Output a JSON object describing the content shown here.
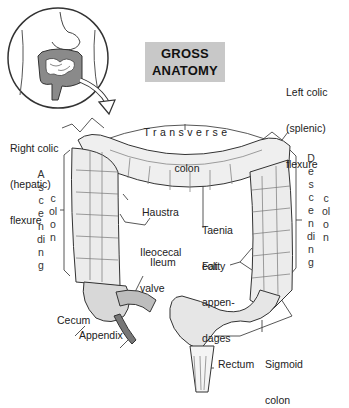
{
  "title": {
    "line1": "GROSS",
    "line2": "ANATOMY"
  },
  "labels": {
    "right_colic": {
      "line1": "Right colic",
      "line2": "(hepatic)",
      "line3": "flexure"
    },
    "transverse": {
      "line1": "Transverse",
      "line2": "colon"
    },
    "left_colic": {
      "line1": "Left colic",
      "line2": "(splenic)",
      "line3": "flexure"
    },
    "ascending": {
      "word1": "Ascending",
      "word2": "colon"
    },
    "descending": {
      "word1": "Descending",
      "word2": "colon"
    },
    "haustra": "Haustra",
    "taenia_coli": {
      "line1": "Taenia",
      "line2": "coli"
    },
    "ileocecal_valve": {
      "line1": "Ileocecal",
      "line2": "valve"
    },
    "ileum": "Ileum",
    "fatty_appendages": {
      "line1": "Fatty",
      "line2": "appen-",
      "line3": "dages"
    },
    "cecum": "Cecum",
    "appendix": "Appendix",
    "sigmoid_colon": {
      "line1": "Sigmoid",
      "line2": "colon"
    },
    "rectum": "Rectum"
  },
  "colors": {
    "title_bg": "#c8c8c8",
    "line": "#333333",
    "colon_fill": "#eeeeee",
    "shade": "#9a9a9a",
    "inset_fill": "#888888"
  }
}
